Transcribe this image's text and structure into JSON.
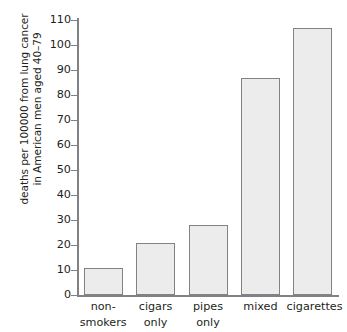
{
  "chart_data": {
    "type": "bar",
    "title": "",
    "subtitle": "",
    "xlabel": "",
    "ylabel": "deaths per 100000 from lung cancer in American men aged 40–79",
    "ylabel_lines": [
      "deaths per 100000 from lung cancer",
      "in American men aged 40–79"
    ],
    "categories": [
      "non-smokers",
      "cigars only",
      "pipes only",
      "mixed",
      "cigarettes"
    ],
    "category_label_lines": [
      [
        "non-",
        "smokers"
      ],
      [
        "cigars",
        "only"
      ],
      [
        "pipes",
        "only"
      ],
      [
        "mixed"
      ],
      [
        "cigarettes"
      ]
    ],
    "values": [
      11,
      21,
      28,
      87,
      107
    ],
    "ylim": [
      0,
      110
    ],
    "ytick_step": 10,
    "yticks": [
      0,
      10,
      20,
      30,
      40,
      50,
      60,
      70,
      80,
      90,
      100,
      110
    ],
    "ytick_labels": [
      "0",
      "10",
      "20",
      "30",
      "40",
      "50",
      "60",
      "70",
      "80",
      "90",
      "100",
      "110"
    ],
    "grid": false,
    "legend": false,
    "legend_position": "none",
    "bar_fill_color": "#ececec",
    "bar_border_color": "#808285",
    "axis_color": "#808285",
    "text_color": "#231f20",
    "background_color": "#ffffff"
  }
}
